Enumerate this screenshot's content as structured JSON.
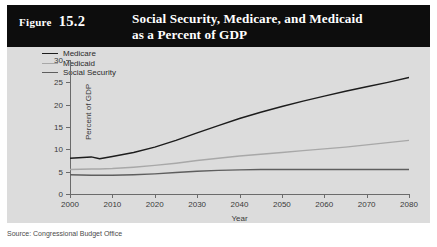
{
  "header": {
    "figure_word": "Figure",
    "figure_number": "15.2",
    "title_line1": "Social Security, Medicare, and Medicaid",
    "title_line2": "as a Percent of GDP"
  },
  "source": {
    "text": "Source: Congressional Budget Office"
  },
  "colors": {
    "header_bg": "#0d0d0d",
    "header_fg": "#ffffff",
    "panel_bg": "#dcdcdc",
    "axis": "#6b6b6b",
    "medicare": "#1c1c1c",
    "medicaid": "#a8a8a8",
    "social_security": "#5e5e5e"
  },
  "chart_data": {
    "type": "line",
    "title": "Social Security, Medicare, and Medicaid as a Percent of GDP",
    "xlabel": "Year",
    "ylabel": "Percent of GDP",
    "xlim": [
      2000,
      2080
    ],
    "ylim": [
      0,
      30
    ],
    "xticks": [
      2000,
      2010,
      2020,
      2030,
      2040,
      2050,
      2060,
      2070,
      2080
    ],
    "yticks": [
      0,
      5,
      10,
      15,
      20,
      25,
      30
    ],
    "grid": false,
    "legend_position": "top-left",
    "x": [
      2000,
      2005,
      2007,
      2010,
      2015,
      2020,
      2025,
      2030,
      2035,
      2040,
      2045,
      2050,
      2055,
      2060,
      2065,
      2070,
      2075,
      2080
    ],
    "series": [
      {
        "name": "Medicare",
        "color": "#1c1c1c",
        "values": [
          8.0,
          8.3,
          7.9,
          8.4,
          9.3,
          10.5,
          12.0,
          13.7,
          15.3,
          16.9,
          18.3,
          19.6,
          20.8,
          21.9,
          23.0,
          24.0,
          25.0,
          26.1
        ]
      },
      {
        "name": "Medicaid",
        "color": "#a8a8a8",
        "values": [
          5.5,
          5.6,
          5.6,
          5.7,
          6.0,
          6.4,
          6.9,
          7.5,
          8.0,
          8.5,
          8.9,
          9.3,
          9.7,
          10.1,
          10.5,
          11.0,
          11.5,
          12.0
        ]
      },
      {
        "name": "Social Security",
        "color": "#5e5e5e",
        "values": [
          4.3,
          4.2,
          4.2,
          4.2,
          4.3,
          4.5,
          4.8,
          5.1,
          5.3,
          5.4,
          5.5,
          5.5,
          5.5,
          5.5,
          5.5,
          5.5,
          5.5,
          5.5
        ]
      }
    ]
  }
}
